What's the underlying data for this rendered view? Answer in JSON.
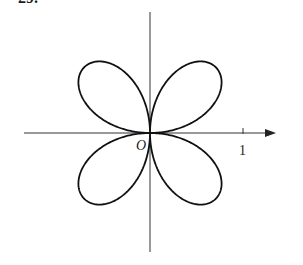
{
  "problem_number": "29.",
  "figure": {
    "curve": "r = sin 2θ",
    "origin_label": "O",
    "x_tick_label": "1",
    "colors": {
      "curve": "#111111",
      "axis": "#333333",
      "background": "#ffffff"
    },
    "geometry": {
      "origin": [
        150,
        133
      ],
      "unit_px": 93,
      "x_axis": [
        24,
        276
      ],
      "y_axis": [
        12,
        252
      ],
      "tick_x": 243
    }
  }
}
